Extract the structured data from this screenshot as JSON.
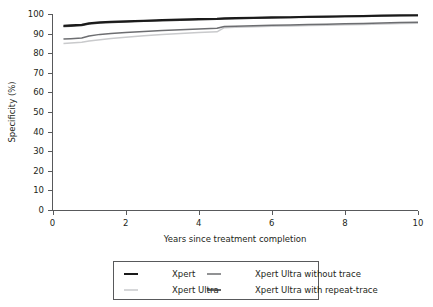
{
  "chart_data": {
    "type": "line",
    "title": "",
    "xlabel": "Years since treatment completion",
    "ylabel": "Specificity (%)",
    "xlim": [
      0,
      10
    ],
    "ylim": [
      0,
      100
    ],
    "xticks": [
      0,
      2,
      4,
      6,
      8,
      10
    ],
    "yticks": [
      0,
      10,
      20,
      30,
      40,
      50,
      60,
      70,
      80,
      90,
      100
    ],
    "grid": false,
    "legend_position": "bottom-center",
    "legend_columns": 2,
    "series": [
      {
        "name": "Xpert",
        "color": "#1a1a1a",
        "width": 2.0,
        "x": [
          0.3,
          0.5,
          0.8,
          1.0,
          1.3,
          1.6,
          2.0,
          2.5,
          3.0,
          3.5,
          4.0,
          4.5,
          4.7,
          5.0,
          5.5,
          6.0,
          6.5,
          7.0,
          7.5,
          8.0,
          8.5,
          9.0,
          9.5,
          10.0
        ],
        "y": [
          94.0,
          94.2,
          94.5,
          95.3,
          95.8,
          96.0,
          96.3,
          96.6,
          96.9,
          97.2,
          97.4,
          97.6,
          97.8,
          97.9,
          98.1,
          98.3,
          98.4,
          98.6,
          98.7,
          98.9,
          99.0,
          99.2,
          99.3,
          99.4
        ]
      },
      {
        "name": "Xpert Ultra with repeat-trace",
        "color": "#3a3a3a",
        "width": 1.6,
        "x": [
          0.3,
          0.5,
          0.8,
          1.0,
          1.3,
          1.6,
          2.0,
          2.5,
          3.0,
          3.5,
          4.0,
          4.5,
          4.7,
          5.0,
          5.5,
          6.0,
          6.5,
          7.0,
          7.5,
          8.0,
          8.5,
          9.0,
          9.5,
          10.0
        ],
        "y": [
          93.6,
          93.8,
          94.1,
          94.9,
          95.4,
          95.7,
          96.0,
          96.3,
          96.6,
          96.9,
          97.1,
          97.3,
          97.5,
          97.6,
          97.8,
          98.0,
          98.2,
          98.4,
          98.5,
          98.7,
          98.8,
          99.0,
          99.1,
          99.2
        ]
      },
      {
        "name": "Xpert Ultra without trace",
        "color": "#6d6e71",
        "width": 1.5,
        "x": [
          0.3,
          0.5,
          0.8,
          1.0,
          1.3,
          1.6,
          2.0,
          2.5,
          3.0,
          3.5,
          4.0,
          4.5,
          4.7,
          5.0,
          5.5,
          6.0,
          6.5,
          7.0,
          7.5,
          8.0,
          8.5,
          9.0,
          9.5,
          10.0
        ],
        "y": [
          87.2,
          87.4,
          87.8,
          88.8,
          89.6,
          90.1,
          90.6,
          91.1,
          91.6,
          92.0,
          92.4,
          92.7,
          93.6,
          93.8,
          94.0,
          94.2,
          94.4,
          94.6,
          94.8,
          95.0,
          95.2,
          95.4,
          95.6,
          95.8
        ]
      },
      {
        "name": "Xpert Ultra",
        "color": "#c9cacc",
        "width": 1.5,
        "x": [
          0.3,
          0.5,
          0.8,
          1.0,
          1.3,
          1.6,
          2.0,
          2.5,
          3.0,
          3.5,
          4.0,
          4.5,
          4.7,
          5.0,
          5.5,
          6.0,
          6.5,
          7.0,
          7.5,
          8.0,
          8.5,
          9.0,
          9.5,
          10.0
        ],
        "y": [
          85.0,
          85.2,
          85.6,
          86.2,
          86.9,
          87.5,
          88.2,
          88.9,
          89.5,
          90.0,
          90.5,
          90.9,
          93.0,
          93.2,
          93.5,
          93.7,
          93.9,
          94.1,
          94.3,
          94.5,
          94.7,
          94.9,
          95.1,
          95.3
        ]
      }
    ]
  },
  "axes": {
    "ylabel": "Specificity (%)",
    "xlabel": "Years since treatment completion",
    "ytick_labels": [
      "0",
      "10",
      "20",
      "30",
      "40",
      "50",
      "60",
      "70",
      "80",
      "90",
      "100"
    ],
    "xtick_labels": [
      "0",
      "2",
      "4",
      "6",
      "8",
      "10"
    ]
  },
  "legend": {
    "entries": [
      {
        "label": "Xpert",
        "color": "#1a1a1a",
        "width": 2.0
      },
      {
        "label": "Xpert Ultra without trace",
        "color": "#6d6e71",
        "width": 1.5
      },
      {
        "label": "Xpert Ultra",
        "color": "#c9cacc",
        "width": 1.5
      },
      {
        "label": "Xpert Ultra with repeat-trace",
        "color": "#3a3a3a",
        "width": 1.6
      }
    ]
  },
  "colors": {
    "axis": "#58595b",
    "text": "#231f20",
    "background": "#ffffff"
  }
}
